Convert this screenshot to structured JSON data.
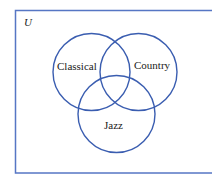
{
  "diagram": {
    "type": "venn",
    "universe_label": "U",
    "sets": [
      {
        "name": "Classical",
        "label": "Classical"
      },
      {
        "name": "Country",
        "label": "Country"
      },
      {
        "name": "Jazz",
        "label": "Jazz"
      }
    ],
    "colors": {
      "stroke": "#3a5db0",
      "text": "#1a1a1a",
      "background": "#ffffff"
    }
  }
}
